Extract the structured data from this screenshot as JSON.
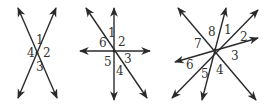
{
  "figures": [
    {
      "name": "two-intersecting-lines",
      "center": [
        37,
        53
      ],
      "lines": [
        {
          "from": [
            18,
            8
          ],
          "to": [
            57,
            98
          ]
        },
        {
          "from": [
            56,
            8
          ],
          "to": [
            18,
            98
          ]
        }
      ],
      "labels": [
        {
          "text": "1",
          "x": 36,
          "y": 44
        },
        {
          "text": "2",
          "x": 43,
          "y": 57
        },
        {
          "text": "3",
          "x": 36,
          "y": 71
        },
        {
          "text": "4",
          "x": 27,
          "y": 57
        }
      ]
    },
    {
      "name": "three-intersecting-lines",
      "center": [
        114,
        51
      ],
      "lines": [
        {
          "from": [
            114,
            100
          ],
          "to": [
            114,
            8
          ]
        },
        {
          "from": [
            150,
            51
          ],
          "to": [
            80,
            51
          ]
        },
        {
          "from": [
            147,
            98
          ],
          "to": [
            86,
            8
          ]
        }
      ],
      "labels": [
        {
          "text": "1",
          "x": 108,
          "y": 37
        },
        {
          "text": "2",
          "x": 118,
          "y": 46
        },
        {
          "text": "3",
          "x": 124,
          "y": 63
        },
        {
          "text": "4",
          "x": 116,
          "y": 75
        },
        {
          "text": "5",
          "x": 104,
          "y": 66
        },
        {
          "text": "6",
          "x": 99,
          "y": 47
        }
      ]
    },
    {
      "name": "four-intersecting-lines",
      "center": [
        215,
        50
      ],
      "lines": [
        {
          "from": [
            256,
            100
          ],
          "to": [
            178,
            8
          ]
        },
        {
          "from": [
            202,
            100
          ],
          "to": [
            226,
            8
          ]
        },
        {
          "from": [
            172,
            98
          ],
          "to": [
            258,
            10
          ]
        },
        {
          "from": [
            175,
            62
          ],
          "to": [
            258,
            38
          ]
        }
      ],
      "labels": [
        {
          "text": "8",
          "x": 208,
          "y": 36
        },
        {
          "text": "1",
          "x": 224,
          "y": 34
        },
        {
          "text": "2",
          "x": 240,
          "y": 41
        },
        {
          "text": "3",
          "x": 231,
          "y": 60
        },
        {
          "text": "4",
          "x": 216,
          "y": 74
        },
        {
          "text": "5",
          "x": 201,
          "y": 78
        },
        {
          "text": "6",
          "x": 186,
          "y": 69
        },
        {
          "text": "7",
          "x": 194,
          "y": 48
        }
      ]
    }
  ]
}
